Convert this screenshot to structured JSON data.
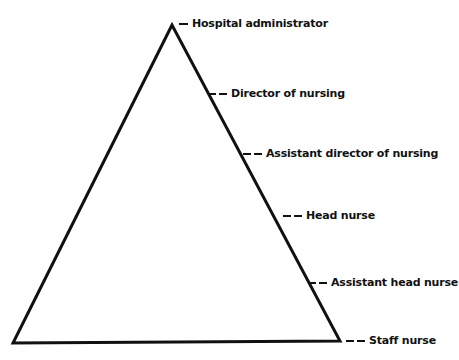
{
  "diagram": {
    "type": "hierarchy-pyramid",
    "levels": [
      {
        "label": "Hospital administrator"
      },
      {
        "label": "Director of nursing"
      },
      {
        "label": "Assistant director of nursing"
      },
      {
        "label": "Head nurse"
      },
      {
        "label": "Assistant head nurse"
      },
      {
        "label": "Staff nurse"
      }
    ]
  }
}
